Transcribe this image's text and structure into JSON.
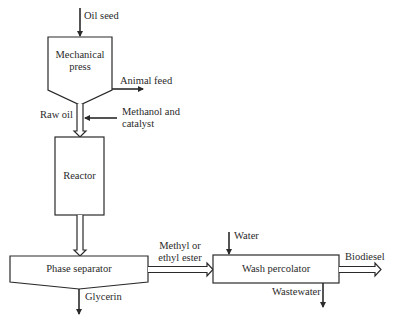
{
  "diagram": {
    "type": "process-flow",
    "units": {
      "mechanical_press": {
        "label_line1": "Mechanical",
        "label_line2": "press"
      },
      "reactor": {
        "label": "Reactor"
      },
      "phase_separator": {
        "label": "Phase separator"
      },
      "wash_percolator": {
        "label": "Wash percolator"
      }
    },
    "streams": {
      "oil_seed": "Oil seed",
      "animal_feed": "Animal feed",
      "raw_oil": "Raw oil",
      "methanol_line1": "Methanol and",
      "methanol_line2": "catalyst",
      "ester_line1": "Methyl or",
      "ester_line2": "ethyl ester",
      "water": "Water",
      "biodiesel": "Biodiesel",
      "wastewater": "Wastewater",
      "glycerin": "Glycerin"
    },
    "colors": {
      "stroke": "#2a2a2a",
      "background": "#ffffff"
    }
  }
}
